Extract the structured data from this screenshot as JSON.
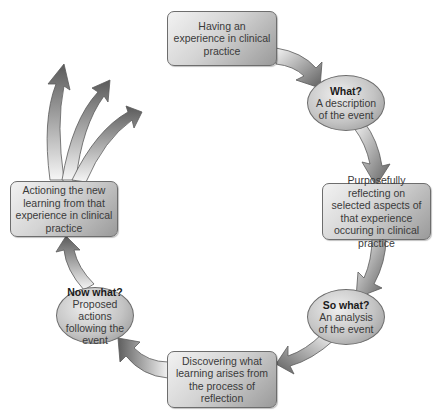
{
  "diagram": {
    "type": "reflective-cycle",
    "nodes": [
      {
        "id": "experience",
        "shape": "rounded-rect",
        "text": "Having an experience in clinical practice"
      },
      {
        "id": "what",
        "shape": "ellipse",
        "question": "What?",
        "text": "A description of the event"
      },
      {
        "id": "reflecting",
        "shape": "rounded-rect",
        "text": "Purposefully reflecting on selected aspects of that experience occuring in clinical practice"
      },
      {
        "id": "so-what",
        "shape": "ellipse",
        "question": "So what?",
        "text": "An analysis of the event"
      },
      {
        "id": "discovering",
        "shape": "rounded-rect",
        "text": "Discovering what learning arises from the process of reflection"
      },
      {
        "id": "now-what",
        "shape": "ellipse",
        "question": "Now what?",
        "text": "Proposed actions following the event"
      },
      {
        "id": "actioning",
        "shape": "rounded-rect",
        "text": "Actioning the new learning from that experience in clinical practice"
      }
    ],
    "edges": [
      [
        "experience",
        "what"
      ],
      [
        "what",
        "reflecting"
      ],
      [
        "reflecting",
        "so-what"
      ],
      [
        "so-what",
        "discovering"
      ],
      [
        "discovering",
        "now-what"
      ],
      [
        "now-what",
        "actioning"
      ],
      [
        "actioning",
        "outward (3 branching arrows)"
      ]
    ],
    "colors": {
      "fill_light": "#f2f2f2",
      "fill_dark": "#8e8e8e",
      "stroke": "#6d6d6d",
      "text": "#3a3a3a"
    }
  }
}
